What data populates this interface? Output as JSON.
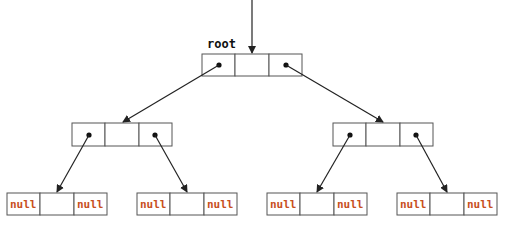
{
  "diagram": {
    "root_label": "root",
    "null_label": "null",
    "colors": {
      "null_text": "#c8501e",
      "box_stroke": "#555555",
      "arrow": "#222222"
    },
    "nodes": [
      {
        "id": "root",
        "level": 0,
        "x": 202,
        "y": 54,
        "left": "pointer",
        "right": "pointer"
      },
      {
        "id": "left-child",
        "level": 1,
        "x": 72,
        "y": 123,
        "left": "pointer",
        "right": "pointer"
      },
      {
        "id": "right-child",
        "level": 1,
        "x": 333,
        "y": 123,
        "left": "pointer",
        "right": "pointer"
      },
      {
        "id": "leaf-1",
        "level": 2,
        "x": 7,
        "y": 193,
        "left": "null",
        "right": "null"
      },
      {
        "id": "leaf-2",
        "level": 2,
        "x": 137,
        "y": 193,
        "left": "null",
        "right": "null"
      },
      {
        "id": "leaf-3",
        "level": 2,
        "x": 267,
        "y": 193,
        "left": "null",
        "right": "null"
      },
      {
        "id": "leaf-4",
        "level": 2,
        "x": 397,
        "y": 193,
        "left": "null",
        "right": "null"
      }
    ],
    "edges": [
      {
        "from": "external",
        "to": "root"
      },
      {
        "from": "root.left",
        "to": "left-child"
      },
      {
        "from": "root.right",
        "to": "right-child"
      },
      {
        "from": "left-child.left",
        "to": "leaf-1"
      },
      {
        "from": "left-child.right",
        "to": "leaf-2"
      },
      {
        "from": "right-child.left",
        "to": "leaf-3"
      },
      {
        "from": "right-child.right",
        "to": "leaf-4"
      }
    ]
  }
}
